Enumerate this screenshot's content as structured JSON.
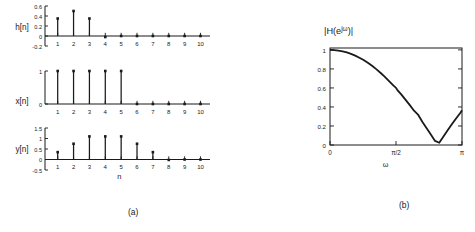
{
  "figure": {
    "panel_a_caption": "(a)",
    "panel_b_caption": "(b)"
  },
  "chart_data": [
    {
      "type": "bar",
      "style": "stem",
      "title": "h[n]",
      "ylabel": "h[n]",
      "xlabel": "",
      "categories": [
        1,
        2,
        3,
        4,
        5,
        6,
        7,
        8,
        9,
        10
      ],
      "values": [
        0.35,
        0.5,
        0.35,
        -0.02,
        0,
        0,
        0,
        0,
        0,
        0
      ],
      "xlim": [
        0.2,
        10.6
      ],
      "ylim": [
        -0.2,
        0.6
      ],
      "yticks": [
        -0.2,
        0,
        0.2,
        0.4,
        0.6
      ],
      "yticklabels": [
        "-0.2",
        "0",
        "0.2",
        "0.4",
        "0.6"
      ],
      "xticks": [
        1,
        2,
        3,
        4,
        5,
        6,
        7,
        8,
        9,
        10
      ],
      "xticklabels": [
        "1",
        "2",
        "3",
        "4",
        "5",
        "6",
        "7",
        "8",
        "9",
        "10"
      ],
      "grid": false,
      "legend": "none"
    },
    {
      "type": "bar",
      "style": "stem",
      "title": "x[n]",
      "ylabel": "x[n]",
      "xlabel": "",
      "categories": [
        1,
        2,
        3,
        4,
        5,
        6,
        7,
        8,
        9,
        10
      ],
      "values": [
        1,
        1,
        1,
        1,
        1,
        0,
        0,
        0,
        0,
        0
      ],
      "xlim": [
        0.2,
        10.6
      ],
      "ylim": [
        0,
        1
      ],
      "yticks": [
        0,
        1
      ],
      "yticklabels": [
        "0",
        "1"
      ],
      "xticks": [
        1,
        2,
        3,
        4,
        5,
        6,
        7,
        8,
        9,
        10
      ],
      "xticklabels": [
        "1",
        "2",
        "3",
        "4",
        "5",
        "6",
        "7",
        "8",
        "9",
        "10"
      ],
      "grid": false,
      "legend": "none"
    },
    {
      "type": "bar",
      "style": "stem",
      "title": "y[n]",
      "ylabel": "y[n]",
      "xlabel": "n",
      "categories": [
        1,
        2,
        3,
        4,
        5,
        6,
        7,
        8,
        9,
        10
      ],
      "values": [
        0.35,
        0.75,
        1.1,
        1.1,
        1.1,
        0.75,
        0.35,
        -0.02,
        0,
        0
      ],
      "xlim": [
        0.2,
        10.6
      ],
      "ylim": [
        -0.5,
        1.5
      ],
      "yticks": [
        -0.5,
        0,
        0.5,
        1,
        1.5
      ],
      "yticklabels": [
        "-0.5",
        "0",
        "0.5",
        "1",
        "1.5"
      ],
      "xticks": [
        1,
        2,
        3,
        4,
        5,
        6,
        7,
        8,
        9,
        10
      ],
      "xticklabels": [
        "1",
        "2",
        "3",
        "4",
        "5",
        "6",
        "7",
        "8",
        "9",
        "10"
      ],
      "grid": false,
      "legend": "none"
    },
    {
      "type": "line",
      "title": "|H(e^{jω})|",
      "title_parts": {
        "pre": "|H(e",
        "sup": "jω",
        "post": ")|"
      },
      "xlabel": "ω",
      "ylabel": "",
      "xlim": [
        0,
        3.14159
      ],
      "ylim": [
        0,
        1.02
      ],
      "yticks": [
        0,
        0.2,
        0.4,
        0.6,
        0.8,
        1
      ],
      "yticklabels": [
        "0",
        "0.2",
        "0.4",
        "0.6",
        "0.8",
        "1"
      ],
      "xticks": [
        0,
        1.5708,
        3.14159
      ],
      "xticklabels": [
        "0",
        "π/2",
        "π"
      ],
      "grid": false,
      "legend": "none",
      "x": [
        0,
        0.1,
        0.2,
        0.3,
        0.4,
        0.5,
        0.6,
        0.7,
        0.8,
        0.9,
        1.0,
        1.1,
        1.2,
        1.3,
        1.4,
        1.5,
        1.5708,
        1.6,
        1.7,
        1.8,
        1.9,
        2.0,
        2.0944,
        2.2,
        2.3,
        2.4,
        2.5,
        2.6,
        2.7,
        2.8,
        2.9,
        3.0,
        3.1,
        3.14159
      ],
      "y": [
        1.0,
        0.998,
        0.993,
        0.985,
        0.973,
        0.958,
        0.94,
        0.918,
        0.893,
        0.864,
        0.833,
        0.798,
        0.76,
        0.719,
        0.675,
        0.629,
        0.601,
        0.58,
        0.529,
        0.475,
        0.419,
        0.361,
        0.32,
        0.241,
        0.176,
        0.11,
        0.043,
        0.024,
        0.09,
        0.155,
        0.218,
        0.279,
        0.337,
        0.364
      ],
      "annotations": {
        "zero_crossing": "2π/3",
        "value_at_pi": 0.37
      }
    }
  ]
}
